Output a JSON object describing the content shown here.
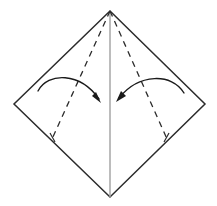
{
  "figure": {
    "type": "origami-step-diagram",
    "canvas": {
      "width": 217,
      "height": 206
    },
    "background_color": "#ffffff"
  },
  "colors": {
    "outline": "#2b2b2b",
    "crease_dashed": "#2b2b2b",
    "center_line": "#a0a0a0",
    "arrow": "#1a1a1a",
    "paper_fill": "#ffffff"
  },
  "shapes": {
    "sheet": {
      "name": "square-paper-rotated-45",
      "points": "110,11 205,104 110,197 14,104",
      "stroke_width": 1.5
    },
    "center_crease": {
      "name": "vertical-center-crease",
      "x1": 110,
      "y1": 11,
      "x2": 110,
      "y2": 197,
      "stroke_width": 1.4
    },
    "crease_left": {
      "name": "left-diagonal-crease",
      "x1": 110,
      "y1": 11,
      "x2": 52,
      "y2": 139,
      "dash": "6 5",
      "stroke_width": 1.3
    },
    "crease_right": {
      "name": "right-diagonal-crease",
      "x1": 110,
      "y1": 11,
      "x2": 167,
      "y2": 139,
      "dash": "6 5",
      "stroke_width": 1.3
    },
    "tick_left": {
      "name": "left-crease-end-tick",
      "x1": 50,
      "y1": 133,
      "x2": 55,
      "y2": 142
    },
    "tick_right": {
      "name": "right-crease-end-tick",
      "x1": 169,
      "y1": 133,
      "x2": 164,
      "y2": 142
    },
    "arrow_left": {
      "name": "left-fold-arrow",
      "path": "M 38,91 C 48,72 80,72 99,99",
      "stroke_width": 1.4,
      "head_points": "101,103 92,96 96,92",
      "direction": "clockwise-inward"
    },
    "arrow_right": {
      "name": "right-fold-arrow",
      "path": "M 184,93 C 172,73 139,73 119,98",
      "stroke_width": 1.4,
      "head_points": "116,102 126,96 121,91",
      "direction": "counterclockwise-inward"
    }
  },
  "labels": {
    "caption": ""
  }
}
